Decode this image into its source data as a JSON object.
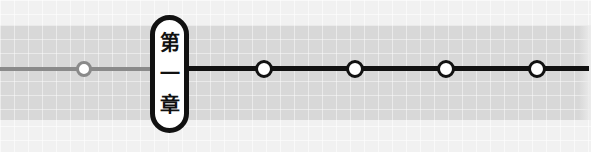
{
  "timeline": {
    "chapter_label": [
      "第",
      "一",
      "章"
    ],
    "chapter_text": "第一章",
    "nodes": [
      {
        "x": 84,
        "state": "past"
      },
      {
        "x": 264,
        "state": "future"
      },
      {
        "x": 355,
        "state": "future"
      },
      {
        "x": 446,
        "state": "future"
      },
      {
        "x": 537,
        "state": "future"
      }
    ],
    "colors": {
      "background": "#f1f1f1",
      "band": "#d8d8d8",
      "past_line": "#8a8a8a",
      "future_line": "#111111",
      "node_fill": "#ffffff"
    }
  }
}
